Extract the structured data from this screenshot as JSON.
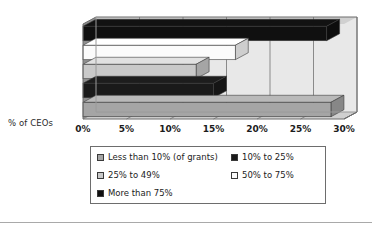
{
  "chart_data": {
    "type": "bar",
    "orientation": "horizontal",
    "title": "",
    "xlabel": "% of CEOs",
    "ylabel": "",
    "xlim": [
      0,
      30
    ],
    "xtick_labels": [
      "0%",
      "5%",
      "10%",
      "15%",
      "20%",
      "25%",
      "30%"
    ],
    "xticks": [
      0,
      5,
      10,
      15,
      20,
      25,
      30
    ],
    "grid": true,
    "legend_position": "bottom",
    "three_d": true,
    "categories": [
      "Less than 10% (of grants)",
      "10% to 25%",
      "25% to 49%",
      "50% to 75%",
      "More than 75%"
    ],
    "values": [
      28.5,
      15.0,
      13.0,
      17.5,
      28.0
    ],
    "bars": [
      {
        "label": "Less than 10% (of grants)",
        "value": 28.5,
        "color": "#a5a5a5",
        "order": 5
      },
      {
        "label": "10% to 25%",
        "value": 15.0,
        "color": "#1a1a1a",
        "order": 4
      },
      {
        "label": "25% to 49%",
        "value": 13.0,
        "color": "#c9c9c9",
        "order": 3
      },
      {
        "label": "50% to 75%",
        "value": 17.5,
        "color": "#fbfbfb",
        "order": 2
      },
      {
        "label": "More than 75%",
        "value": 28.0,
        "color": "#101010",
        "order": 1
      }
    ]
  },
  "axis": {
    "y_axis_title": "% of CEOs"
  },
  "legend": {
    "entries": [
      {
        "label": "Less than 10% (of grants)",
        "color": "#a5a5a5"
      },
      {
        "label": "10% to 25%",
        "color": "#1a1a1a"
      },
      {
        "label": "25% to 49%",
        "color": "#c9c9c9"
      },
      {
        "label": "50% to 75%",
        "color": "#fbfbfb"
      },
      {
        "label": "More than 75%",
        "color": "#101010"
      }
    ]
  },
  "colors": {
    "plot_background": "#e8e8e8",
    "plot_top_face": "#d0d0d0",
    "plot_left_face": "#8f8f8f",
    "floor_face": "#cfcfcf",
    "gridline": "#8a8a8a",
    "border": "#6d6d6d",
    "text": "#1c1c1c"
  }
}
